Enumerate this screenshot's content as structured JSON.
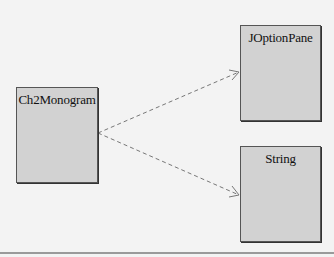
{
  "diagram": {
    "type": "UML class dependency diagram",
    "classes": [
      {
        "id": "ch2monogram",
        "name": "Ch2Monogram"
      },
      {
        "id": "joptionpane",
        "name": "JOptionPane"
      },
      {
        "id": "string",
        "name": "String"
      }
    ],
    "dependencies": [
      {
        "from": "Ch2Monogram",
        "to": "JOptionPane",
        "style": "dashed",
        "arrowhead": "open"
      },
      {
        "from": "Ch2Monogram",
        "to": "String",
        "style": "dashed",
        "arrowhead": "open"
      }
    ],
    "colors": {
      "background": "#f3f3f3",
      "box_fill": "#d2d2d2",
      "box_border": "#555555",
      "arrow": "#777777"
    }
  }
}
